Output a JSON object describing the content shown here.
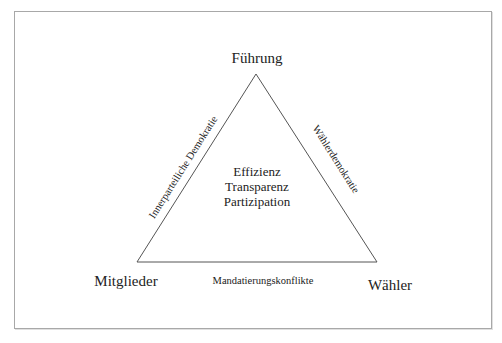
{
  "diagram": {
    "vertices": {
      "top": "Führung",
      "bottom_left": "Mitglieder",
      "bottom_right": "Wähler"
    },
    "edges": {
      "left": "Innerparteiliche Demokratie",
      "right": "Wählerdemokratie",
      "bottom": "Mandatierungskonflikte"
    },
    "center": [
      "Effizienz",
      "Transparenz",
      "Partizipation"
    ],
    "colors": {
      "line": "#555555",
      "text": "#222222",
      "frame": "#a8a8a8"
    }
  }
}
